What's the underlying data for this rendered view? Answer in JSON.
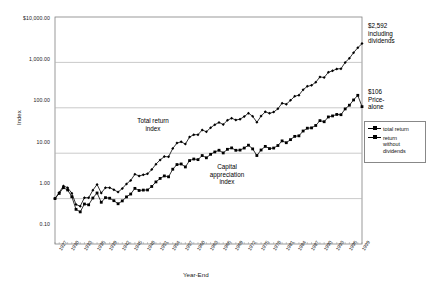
{
  "chart_data": {
    "type": "line",
    "title": "",
    "xlabel": "Year-End",
    "ylabel": "Index",
    "log_y": true,
    "ylim": [
      0.1,
      10000.0
    ],
    "y_ticks": [
      "$10,000.00",
      "1,000.00",
      "100.00",
      "10.00",
      "1.00",
      "0.10"
    ],
    "y_tick_values": [
      10000,
      1000,
      100,
      10,
      1,
      0.1
    ],
    "grid": "horizontal",
    "legend_position": "right-middle",
    "x_start_year": 1926,
    "x_end_year": 1999,
    "x_tick_labels": [
      "1927",
      "1930",
      "1933",
      "1936",
      "1939",
      "1942",
      "1945",
      "1948",
      "1951",
      "1954",
      "1957",
      "1960",
      "1963",
      "1966",
      "1969",
      "1972",
      "1975",
      "1978",
      "1981",
      "1984",
      "1987",
      "1990",
      "1993",
      "1996",
      "1999"
    ],
    "series": [
      {
        "name": "total return",
        "color": "#000000",
        "marker": "diamond",
        "x": [
          1926,
          1927,
          1928,
          1929,
          1930,
          1931,
          1932,
          1933,
          1934,
          1935,
          1936,
          1937,
          1938,
          1939,
          1940,
          1941,
          1942,
          1943,
          1944,
          1945,
          1946,
          1947,
          1948,
          1949,
          1950,
          1951,
          1952,
          1953,
          1954,
          1955,
          1956,
          1957,
          1958,
          1959,
          1960,
          1961,
          1962,
          1963,
          1964,
          1965,
          1966,
          1967,
          1968,
          1969,
          1970,
          1971,
          1972,
          1973,
          1974,
          1975,
          1976,
          1977,
          1978,
          1979,
          1980,
          1981,
          1982,
          1983,
          1984,
          1985,
          1986,
          1987,
          1988,
          1989,
          1990,
          1991,
          1992,
          1993,
          1994,
          1995,
          1996,
          1997,
          1998,
          1999
        ],
        "values": [
          1.0,
          1.37,
          1.9,
          1.74,
          1.31,
          0.74,
          0.68,
          1.05,
          1.04,
          1.53,
          2.05,
          1.33,
          1.74,
          1.74,
          1.57,
          1.39,
          1.67,
          2.11,
          2.52,
          3.44,
          3.16,
          3.34,
          3.51,
          4.35,
          5.73,
          7.11,
          8.41,
          8.33,
          12.71,
          16.72,
          17.81,
          15.89,
          22.77,
          25.49,
          25.6,
          32.49,
          29.65,
          36.42,
          42.44,
          47.67,
          42.88,
          53.14,
          58.96,
          53.94,
          56.1,
          64.13,
          76.29,
          65.09,
          47.85,
          65.67,
          81.37,
          75.55,
          80.5,
          95.35,
          126.27,
          120.07,
          145.84,
          178.78,
          190.0,
          250.29,
          296.85,
          312.42,
          364.11,
          479.47,
          464.48,
          605.83,
          651.85,
          717.32,
          726.76,
          999.55,
          1228.59,
          1638.45,
          2106.71,
          2592.0
        ]
      },
      {
        "name": "return without dividends",
        "color": "#000000",
        "marker": "square",
        "x": [
          1926,
          1927,
          1928,
          1929,
          1930,
          1931,
          1932,
          1933,
          1934,
          1935,
          1936,
          1937,
          1938,
          1939,
          1940,
          1941,
          1942,
          1943,
          1944,
          1945,
          1946,
          1947,
          1948,
          1949,
          1950,
          1951,
          1952,
          1953,
          1954,
          1955,
          1956,
          1957,
          1958,
          1959,
          1960,
          1961,
          1962,
          1963,
          1964,
          1965,
          1966,
          1967,
          1968,
          1969,
          1970,
          1971,
          1972,
          1973,
          1974,
          1975,
          1976,
          1977,
          1978,
          1979,
          1980,
          1981,
          1982,
          1983,
          1984,
          1985,
          1986,
          1987,
          1988,
          1989,
          1990,
          1991,
          1992,
          1993,
          1994,
          1995,
          1996,
          1997,
          1998,
          1999
        ],
        "values": [
          1.0,
          1.3,
          1.74,
          1.55,
          1.1,
          0.58,
          0.51,
          0.76,
          0.73,
          1.03,
          1.33,
          0.83,
          1.05,
          1.02,
          0.9,
          0.77,
          0.89,
          1.09,
          1.26,
          1.68,
          1.51,
          1.54,
          1.55,
          1.85,
          2.33,
          2.78,
          3.16,
          3.02,
          4.44,
          5.62,
          5.79,
          4.98,
          6.88,
          7.44,
          7.22,
          8.88,
          7.92,
          9.45,
          10.65,
          11.61,
          10.14,
          12.18,
          13.08,
          11.59,
          11.71,
          12.99,
          15.02,
          12.44,
          8.89,
          11.76,
          14.13,
          12.65,
          12.98,
          14.76,
          18.68,
          17.02,
          19.89,
          23.47,
          24.13,
          30.82,
          35.55,
          36.12,
          40.81,
          52.18,
          49.34,
          62.92,
          66.25,
          71.37,
          70.46,
          94.52,
          114.06,
          148.85,
          188.3,
          106.0
        ]
      }
    ],
    "annotations": [
      {
        "name": "total-return-endpoint",
        "text": "$2,592\ninkluding"
      },
      {
        "name": "price-alone-endpoint",
        "text": "$106"
      }
    ]
  },
  "axes": {
    "y_title": "Index",
    "x_title": "Year-End",
    "y_ticks": [
      {
        "label": "$10,000.00",
        "value": 10000
      },
      {
        "label": "1,000.00",
        "value": 1000
      },
      {
        "label": "100.00",
        "value": 100
      },
      {
        "label": "10.00",
        "value": 10
      },
      {
        "label": "1.00",
        "value": 1
      },
      {
        "label": "0.10",
        "value": 0.1
      }
    ],
    "x_ticks": [
      "1927",
      "1930",
      "1933",
      "1936",
      "1939",
      "1942",
      "1945",
      "1948",
      "1951",
      "1954",
      "1957",
      "1960",
      "1963",
      "1966",
      "1969",
      "1972",
      "1975",
      "1978",
      "1981",
      "1984",
      "1987",
      "1990",
      "1993",
      "1996",
      "1999"
    ]
  },
  "annotations": {
    "total_return_end": "$2,592\nincluding\ndividends",
    "price_alone_end": "$106\nPrice-\nalone",
    "total_return_index": "Total return\nindex",
    "capital_appreciation_index": "Capital\nappreciation\nindex"
  },
  "legend": {
    "items": [
      {
        "label": "total return",
        "marker": "diamond"
      },
      {
        "label": "return\nwithout\ndividends",
        "marker": "square"
      }
    ]
  },
  "colors": {
    "series": "#000000",
    "grid": "#b3b3b3",
    "axis": "#808080",
    "text": "#222222"
  }
}
